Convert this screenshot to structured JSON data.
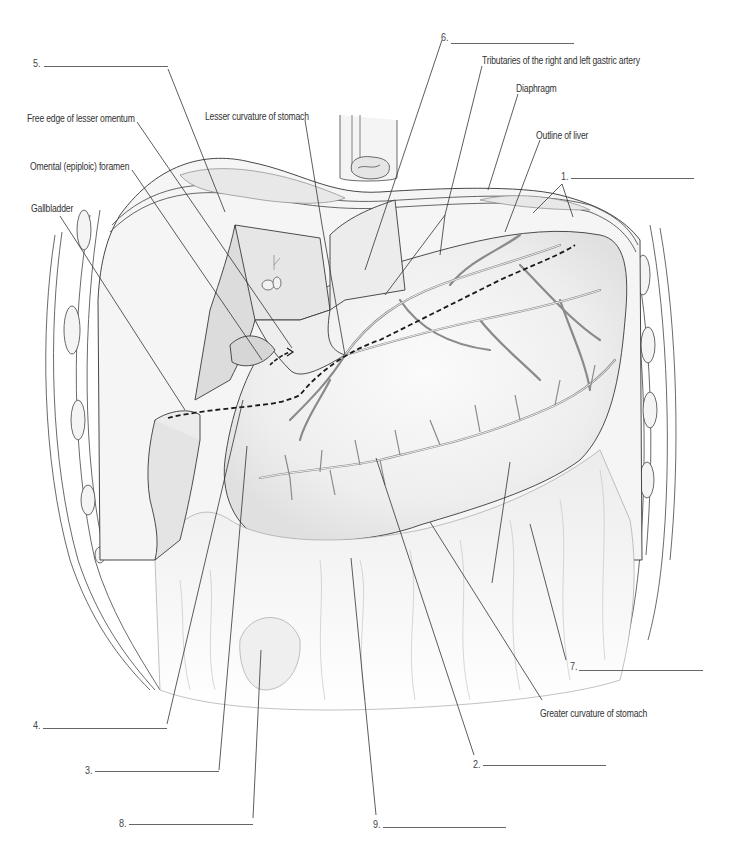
{
  "figure": {
    "colors": {
      "line": "#3a3a3a",
      "organ_fill": "#f2f2f2",
      "shade": "#e2e2e2",
      "vessel": "#8a8a8a",
      "leader": "#333333",
      "dashed": "#1a1a1a"
    }
  },
  "labels": {
    "free_edge_lesser_omentum": "Free edge of lesser omentum",
    "lesser_curvature": "Lesser curvature of stomach",
    "omental_foramen": "Omental (epiploic) foramen",
    "gallbladder": "Gallbladder",
    "tributaries": "Tributaries of the right and left gastric artery",
    "diaphragm": "Diaphragm",
    "outline_liver": "Outline of liver",
    "greater_curvature": "Greater curvature of stomach"
  },
  "blanks": [
    {
      "number": "1.",
      "answer": ""
    },
    {
      "number": "2.",
      "answer": ""
    },
    {
      "number": "3.",
      "answer": ""
    },
    {
      "number": "4.",
      "answer": ""
    },
    {
      "number": "5.",
      "answer": ""
    },
    {
      "number": "6.",
      "answer": ""
    },
    {
      "number": "7.",
      "answer": ""
    },
    {
      "number": "8.",
      "answer": ""
    },
    {
      "number": "9.",
      "answer": ""
    }
  ]
}
